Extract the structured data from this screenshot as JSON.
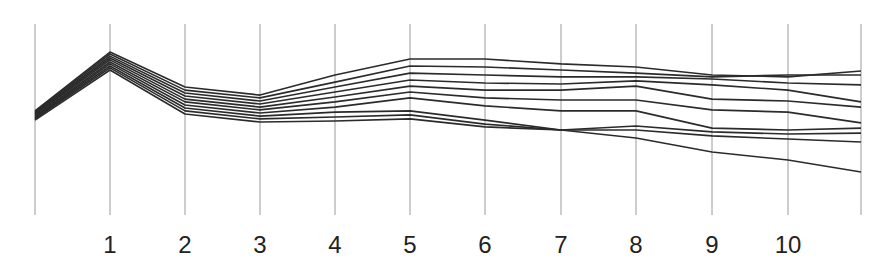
{
  "chart_data": {
    "type": "line",
    "title": "",
    "xlabel": "",
    "ylabel": "",
    "x": [
      0,
      1,
      2,
      3,
      4,
      5,
      6,
      7,
      8,
      9,
      10,
      11
    ],
    "tick_labels": [
      "",
      "1",
      "2",
      "3",
      "4",
      "5",
      "6",
      "7",
      "8",
      "9",
      "10",
      ""
    ],
    "ylim": [
      0,
      100
    ],
    "grid": "vertical axis lines at each x",
    "legend": "none",
    "colors": {
      "line": "#2b2b2b",
      "axis": "#9a9a9a",
      "text": "#222222"
    },
    "series": [
      {
        "name": "series-1",
        "values": [
          54.5,
          85.3,
          67.0,
          62.8,
          73.3,
          81.7,
          81.7,
          79.1,
          77.5,
          73.3,
          72.3,
          75.4
        ]
      },
      {
        "name": "series-2",
        "values": [
          54.0,
          84.3,
          65.4,
          61.3,
          69.6,
          78.0,
          77.5,
          75.9,
          74.3,
          72.3,
          73.3,
          73.3
        ]
      },
      {
        "name": "series-3",
        "values": [
          53.4,
          83.2,
          63.9,
          59.7,
          67.0,
          74.3,
          73.3,
          72.3,
          72.3,
          71.2,
          69.1,
          68.1
        ]
      },
      {
        "name": "series-4",
        "values": [
          52.9,
          82.2,
          62.3,
          58.1,
          64.4,
          70.7,
          69.1,
          68.6,
          70.2,
          68.1,
          65.4,
          59.2
        ]
      },
      {
        "name": "series-5",
        "values": [
          52.4,
          81.2,
          60.7,
          56.5,
          61.8,
          67.5,
          65.4,
          65.4,
          67.5,
          60.7,
          59.7,
          56.5
        ]
      },
      {
        "name": "series-6",
        "values": [
          51.8,
          80.1,
          59.2,
          55.0,
          59.2,
          64.4,
          61.3,
          60.2,
          60.2,
          55.0,
          53.9,
          48.2
        ]
      },
      {
        "name": "series-7",
        "values": [
          51.3,
          79.1,
          57.6,
          53.4,
          56.5,
          61.3,
          57.1,
          54.5,
          54.5,
          45.5,
          44.5,
          45.5
        ]
      },
      {
        "name": "series-8",
        "values": [
          50.8,
          78.0,
          56.0,
          51.8,
          53.9,
          54.5,
          49.7,
          44.5,
          46.6,
          43.5,
          42.4,
          42.9
        ]
      },
      {
        "name": "series-9",
        "values": [
          50.3,
          77.0,
          54.5,
          50.3,
          51.3,
          52.4,
          47.6,
          44.5,
          44.5,
          41.4,
          39.8,
          38.2
        ]
      },
      {
        "name": "series-10",
        "values": [
          49.7,
          75.9,
          52.9,
          48.7,
          49.2,
          50.3,
          46.1,
          44.5,
          40.3,
          33.0,
          28.8,
          22.5
        ]
      }
    ]
  }
}
